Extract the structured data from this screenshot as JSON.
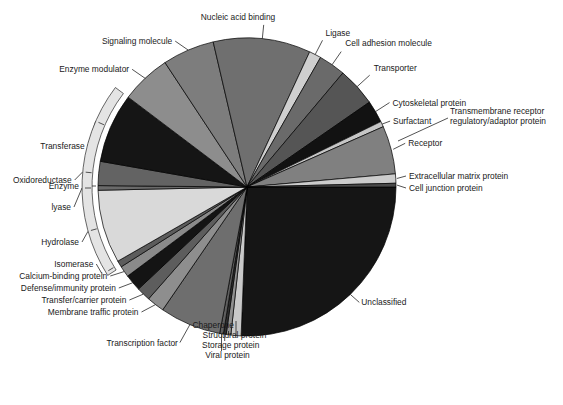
{
  "chart_data": {
    "type": "pie",
    "title": "",
    "subtitle": "",
    "xlabel": "",
    "ylabel": "",
    "legend_position": "callout-labels",
    "grid": false,
    "start_angle_deg": 0,
    "direction": "clockwise",
    "center": {
      "x": 247,
      "y": 187
    },
    "radius": 149,
    "bracket": {
      "label": "Enzyme",
      "members": [
        "Transferase",
        "Oxidoreductase",
        "Lyase",
        "Hydrolase",
        "Isomerase"
      ]
    },
    "categories": [
      "Unclassified",
      "Chaperone",
      "Structural protein",
      "Storage protein",
      "Viral protein",
      "Transcription factor",
      "Membrane traffic protein",
      "Transfer/carrier protein",
      "Defense/immunity protein",
      "Calcium-binding protein",
      "Isomerase",
      "Hydrolase",
      "Lyase",
      "Oxidoreductase",
      "Transferase",
      "Enzyme modulator",
      "Signaling molecule",
      "Nucleic acid binding",
      "Ligase",
      "Cell adhesion molecule",
      "Transporter",
      "Cytoskeletal protein",
      "Surfactant",
      "Receptor",
      "Extracellular matrix protein",
      "Cell junction protein"
    ],
    "values": [
      25.5,
      1.1,
      0.5,
      0.3,
      0.4,
      6.6,
      1.9,
      1.5,
      1.8,
      1.2,
      0.7,
      7.9,
      0.5,
      2.6,
      7.5,
      5.4,
      5.6,
      10.5,
      1.3,
      2.9,
      4.2,
      2.4,
      0.6,
      5.2,
      1.0,
      0.4
    ],
    "colors": [
      "#151515",
      "#c9c9c9",
      "#8f8f8f",
      "#2f2f2f",
      "#5e5e5e",
      "#6e6e6e",
      "#8e8e8e",
      "#5d5d5d",
      "#141414",
      "#8a8a8a",
      "#5c5c5c",
      "#d9d9d9",
      "#6a6a6a",
      "#636363",
      "#151515",
      "#8d8d8d",
      "#7d7d7d",
      "#6f6f6f",
      "#cfcfcf",
      "#6a6a6a",
      "#555555",
      "#121212",
      "#c6c6c6",
      "#808080",
      "#cccccc",
      "#4a4a4a"
    ]
  },
  "labels": {
    "nucleic_acid_binding": "Nucleic acid binding",
    "ligase": "Ligase",
    "cell_adhesion_molecule": "Cell adhesion molecule",
    "transporter": "Transporter",
    "cytoskeletal_protein": "Cytoskeletal protein",
    "transmembrane_receptor_l1": "Transmembrane receptor",
    "transmembrane_receptor_l2": "regulatory/adaptor protein",
    "surfactant": "Surfactant",
    "receptor": "Receptor",
    "extracellular_matrix_protein": "Extracellular matrix protein",
    "cell_junction_protein": "Cell junction protein",
    "unclassified": "Unclassified",
    "viral_protein": "Viral protein",
    "storage_protein": "Storage protein",
    "structural_protein": "Structural protein",
    "chaperone": "Chaperone",
    "transcription_factor": "Transcription factor",
    "membrane_traffic_protein": "Membrane traffic protein",
    "transfer_carrier_protein": "Transfer/carrier protein",
    "defense_immunity_protein": "Defense/immunity protein",
    "calcium_binding_protein": "Calcium-binding protein",
    "isomerase": "Isomerase",
    "hydrolase": "Hydrolase",
    "lyase": "lyase",
    "oxidoreductase": "Oxidoreductase",
    "enzyme": "Enzyme",
    "transferase": "Transferase",
    "enzyme_modulator": "Enzyme modulator",
    "signaling_molecule": "Signaling molecule"
  }
}
